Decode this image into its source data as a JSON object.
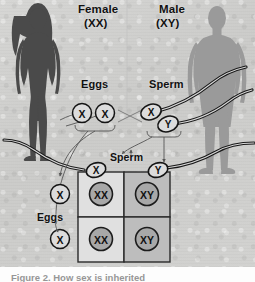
{
  "figure": {
    "title_top_left": "Female",
    "genotype_female": "(XX)",
    "title_top_right": "Male",
    "genotype_male": "(XY)",
    "label_eggs_top": "Eggs",
    "label_sperm_top": "Sperm",
    "label_sperm_middle": "Sperm",
    "label_eggs_left": "Eggs",
    "caption": "Figure 2. How sex is inherited"
  },
  "gametes": {
    "eggs_top": [
      "X",
      "X"
    ],
    "sperm_top": [
      "X",
      "Y"
    ],
    "sperm_header": [
      "X",
      "Y"
    ],
    "eggs_side": [
      "X",
      "X"
    ]
  },
  "punnett": {
    "column_header_label": "Sperm",
    "row_header_label": "Eggs",
    "column_alleles": [
      "X",
      "Y"
    ],
    "row_alleles": [
      "X",
      "X"
    ],
    "cells": [
      [
        "XX",
        "XY"
      ],
      [
        "XX",
        "XY"
      ]
    ]
  },
  "colors": {
    "background": "#cfcfcf",
    "female_silhouette": "#4a4a4a",
    "male_silhouette": "#9a9a9a",
    "cell_light": "#dedede",
    "cell_dark": "#bcbcbc",
    "allele_circle": "#a8a8a8",
    "ink": "#111111",
    "caption_text": "#6f6f6f"
  }
}
